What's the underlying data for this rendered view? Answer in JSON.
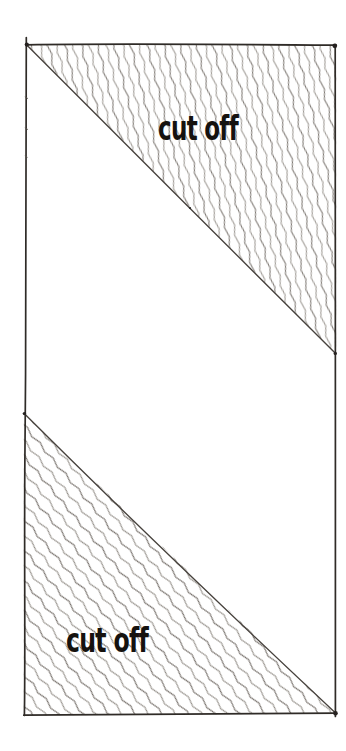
{
  "figure": {
    "type": "hand-drawn cut-off diagram",
    "background_color": "#ffffff",
    "outline_color": "#2f2b27",
    "diagonal_color": "#46413c",
    "hatch_color": "#6b655f",
    "label_color": "#15120f",
    "regions": [
      {
        "id": "top-right-triangle",
        "label": "cut off",
        "hatched": true
      },
      {
        "id": "bottom-left-triangle",
        "label": "cut off",
        "hatched": true
      }
    ]
  }
}
